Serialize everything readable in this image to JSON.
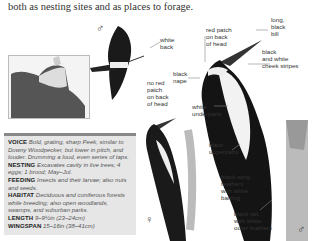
{
  "intro_text": "both as nesting sites and as places to forage.",
  "range_map": {
    "caption": "",
    "region": "Canada / North America range map"
  },
  "info_box": {
    "entries": [
      {
        "key": "VOICE",
        "value": "Bold, grating, sharp Peek, similar to Downy Woodpecker, but lower in pitch, and louder. Drumming a loud, even series of taps."
      },
      {
        "key": "NESTING",
        "value": "Excavates cavity in live trees; 4 eggs; 1 brood; May–Jul."
      },
      {
        "key": "FEEDING",
        "value": "Insects and their larvae; also nuts and seeds."
      },
      {
        "key": "HABITAT",
        "value": "Deciduous and coniferous forests while breeding; also open woodlands, swamps, and suburban parks."
      },
      {
        "key": "LENGTH",
        "value": "9–9½in (23–24cm)"
      },
      {
        "key": "WINGSPAN",
        "value": "15–16in (38–41cm)"
      }
    ]
  },
  "symbols": {
    "male_top": "♂",
    "female": "♀",
    "male_bottom": "♂"
  },
  "labels": {
    "white_back": "white\nback",
    "red_patch": "red patch\non back\nof head",
    "long_bill": "long,\nblack\nbill",
    "cheek_stripes": "black\nand white\ncheek stripes",
    "black_nape": "black\nnape",
    "no_red_patch": "no red\npatch\non back\nof head",
    "white_underparts": "white\nunderparts",
    "black_upperparts": "black\nupperparts",
    "wing_feathers": "black wing\nfeathers\nwith white\nbarring",
    "black_tail": "black tail,\nwith white\nouter feathers"
  }
}
